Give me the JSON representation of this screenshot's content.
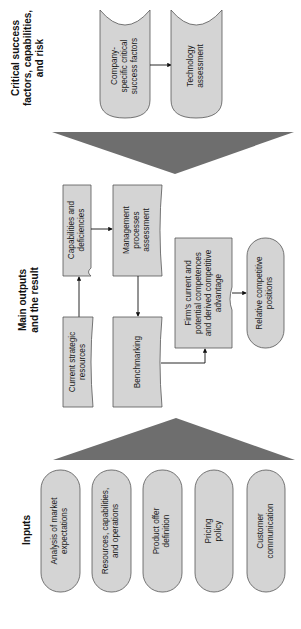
{
  "sections": {
    "critical": {
      "title_lines": [
        "Critical success",
        "factors, capabilities,",
        "and risk"
      ],
      "nodes": [
        {
          "id": "company-csf",
          "lines": [
            "Company-",
            "specific critical",
            "success factors"
          ]
        },
        {
          "id": "tech-assessment",
          "lines": [
            "Technology",
            "assessment"
          ]
        }
      ]
    },
    "main": {
      "title_lines": [
        "Main outputs",
        "and the result"
      ],
      "nodes": [
        {
          "id": "capabilities",
          "lines": [
            "Capabilities and",
            "deficiencies"
          ]
        },
        {
          "id": "management",
          "lines": [
            "Management",
            "processes",
            "assessment"
          ]
        },
        {
          "id": "current-resources",
          "lines": [
            "Current strategic",
            "resources"
          ]
        },
        {
          "id": "benchmarking",
          "lines": [
            "Benchmarking"
          ]
        },
        {
          "id": "firm-competences",
          "lines": [
            "Firm's current and",
            "potential competences",
            "and derived competitive",
            "advantage"
          ]
        },
        {
          "id": "relative-positions",
          "lines": [
            "Relative competitive",
            "positions"
          ]
        }
      ]
    },
    "inputs": {
      "title_lines": [
        "Inputs"
      ],
      "nodes": [
        {
          "id": "market-expectations",
          "lines": [
            "Analysis of market",
            "expectations"
          ]
        },
        {
          "id": "resources-ops",
          "lines": [
            "Resources, capabilities,",
            "and operations"
          ]
        },
        {
          "id": "product-offer",
          "lines": [
            "Product offer",
            "definition"
          ]
        },
        {
          "id": "pricing",
          "lines": [
            "Pricing",
            "policy"
          ]
        },
        {
          "id": "customer-comm",
          "lines": [
            "Customer",
            "communication"
          ]
        }
      ]
    }
  },
  "colors": {
    "node_fill": "#d4d4d4",
    "node_stroke": "#555555",
    "funnel": "#6e6e6e",
    "text": "#1a1a1a"
  }
}
